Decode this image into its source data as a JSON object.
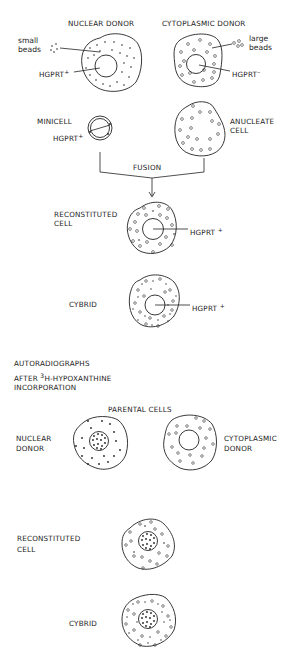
{
  "top_section": {
    "nuclear_donor": {
      "title": "NUCLEAR DONOR",
      "bead_label_1": "small",
      "bead_label_2": "beads",
      "marker": "HGPRT",
      "marker_sign": "+"
    },
    "cytoplasmic_donor": {
      "title": "CYTOPLASMIC DONOR",
      "bead_label_1": "large",
      "bead_label_2": "beads",
      "marker": "HGPRT",
      "marker_sign": "–"
    },
    "minicell": {
      "title": "MINICELL",
      "marker": "HGPRT",
      "marker_sign": "+"
    },
    "anucleate_cell": {
      "line1": "ANUCLEATE",
      "line2": "CELL"
    },
    "fusion_label": "FUSION",
    "reconstituted_cell": {
      "line1": "RECONSTITUTED",
      "line2": "CELL",
      "marker": "HGPRT",
      "marker_sign": "+"
    },
    "cybrid": {
      "title": "CYBRID",
      "marker": "HGPRT",
      "marker_sign": "+"
    }
  },
  "bottom_section": {
    "heading_line1": "AUTORADIOGRAPHS",
    "heading_line2_pre": "AFTER ",
    "heading_line2_sup": "3",
    "heading_line2_post": "H-HYPOXANTHINE",
    "heading_line3": "INCORPORATION",
    "parental_cells_label": "PARENTAL CELLS",
    "nuclear_donor": {
      "line1": "NUCLEAR",
      "line2": "DONOR"
    },
    "cytoplasmic_donor": {
      "line1": "CYTOPLASMIC",
      "line2": "DONOR"
    },
    "reconstituted_cell": {
      "line1": "RECONSTITUTED",
      "line2": "CELL"
    },
    "cybrid": {
      "title": "CYBRID"
    }
  }
}
